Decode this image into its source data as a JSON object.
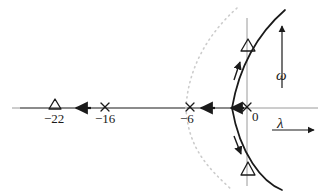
{
  "figure": {
    "kind": "root-locus-plot",
    "width": 329,
    "height": 192,
    "background_color": "#ffffff",
    "line_color": "#1a1a1a",
    "axis_color": "#9a9a9a",
    "guide_color": "#c8c8c8"
  },
  "axes": {
    "real": {
      "name": "lambda",
      "label": "λ",
      "orientation": "horizontal",
      "y_px": 108,
      "x_start_px": 12,
      "x_end_px": 318,
      "arrow_marker": {
        "x_start_px": 273,
        "x_end_px": 317,
        "y_px": 130,
        "direction": "right"
      },
      "label_pos": {
        "x_px": 277,
        "y_px": 116
      }
    },
    "imag": {
      "name": "omega",
      "label": "ω",
      "orientation": "vertical",
      "x_px": 247,
      "y_top_px": 18,
      "y_bottom_px": 186,
      "arrow_marker": {
        "x_px": 282,
        "y_start_px": 88,
        "y_end_px": 26,
        "direction": "up"
      },
      "label_pos": {
        "x_px": 276,
        "y_px": 68
      }
    }
  },
  "scale": {
    "origin_x_px": 247,
    "origin_y_px": 108,
    "px_per_unit": 8.7,
    "note": "lambda = (x_px - 247) / 8.7"
  },
  "tick_labels": [
    {
      "text": "−22",
      "value": -22,
      "x_px": 44,
      "y_px": 112
    },
    {
      "text": "−16",
      "value": -16,
      "x_px": 95,
      "y_px": 112
    },
    {
      "text": "−6",
      "value": -6,
      "x_px": 180,
      "y_px": 112
    },
    {
      "text": "0",
      "value": 0,
      "x_px": 252,
      "y_px": 110
    }
  ],
  "markers": {
    "poles": [
      {
        "symbol": "x",
        "label": "−16",
        "value": -16,
        "x_px": 105,
        "y_px": 108,
        "size_px": 9
      },
      {
        "symbol": "x",
        "label": "−6",
        "value": -6,
        "x_px": 190,
        "y_px": 108,
        "size_px": 9
      },
      {
        "symbol": "x",
        "label": "0",
        "value": 0,
        "x_px": 247,
        "y_px": 108,
        "size_px": 9
      }
    ],
    "zeros": [
      {
        "symbol": "triangle",
        "label": "−22",
        "value": -22,
        "x_px": 55,
        "y_px": 105,
        "size_px": 11
      }
    ],
    "locus_points": [
      {
        "symbol": "triangle",
        "name": "upper-locus-zero",
        "x_px": 248,
        "y_px": 46,
        "size_px": 11
      },
      {
        "symbol": "triangle",
        "name": "lower-locus-zero",
        "x_px": 248,
        "y_px": 169,
        "size_px": 11
      }
    ]
  },
  "direction_arrows": {
    "real_axis": [
      {
        "name": "arrow-neg22-to-neg16",
        "x_px": 83,
        "y_px": 108,
        "direction": "left",
        "length_px": 16
      },
      {
        "name": "arrow-neg6-right",
        "x_px": 207,
        "y_px": 108,
        "direction": "left",
        "length_px": 16
      },
      {
        "name": "arrow-origin-left",
        "x_px": 237,
        "y_px": 108,
        "direction": "left",
        "length_px": 16
      }
    ],
    "locus_branches": [
      {
        "name": "arrow-upper-branch",
        "x_px": 238,
        "y_px": 70,
        "direction": "up-right"
      },
      {
        "name": "arrow-lower-branch",
        "x_px": 239,
        "y_px": 145,
        "direction": "down-right"
      }
    ]
  },
  "curves": {
    "locus_solid": {
      "name": "root-locus-branch",
      "style": "solid",
      "color": "#1a1a1a",
      "width_px": 1.6,
      "path": "M 285 10 C 262 30, 240 62, 232 108 C 240 154, 262 182, 282 190"
    },
    "asymptote_guide": {
      "name": "asymptote-guide-curve",
      "style": "dotted",
      "color": "#c8c8c8",
      "width_px": 1.6,
      "path": "M 237 8 C 208 34, 188 68, 186 108 C 188 148, 208 168, 232 190"
    }
  },
  "labels": {
    "lambda": "λ",
    "omega": "ω",
    "neg22": "−22",
    "neg16": "−16",
    "neg6": "−6",
    "zero": "0"
  }
}
